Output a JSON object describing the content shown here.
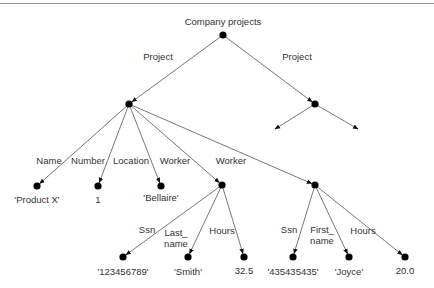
{
  "colors": {
    "edge": "#555555",
    "node": "#000000",
    "text": "#333333",
    "rule": "#999999"
  },
  "root": {
    "label": "Company projects",
    "x": 223,
    "y": 35
  },
  "nodes": [
    {
      "id": "root",
      "x": 223,
      "y": 35
    },
    {
      "id": "p1",
      "x": 129,
      "y": 104
    },
    {
      "id": "p2",
      "x": 315,
      "y": 104
    },
    {
      "id": "name",
      "x": 37,
      "y": 186
    },
    {
      "id": "number",
      "x": 98,
      "y": 186
    },
    {
      "id": "location",
      "x": 161,
      "y": 186
    },
    {
      "id": "w1",
      "x": 222,
      "y": 185
    },
    {
      "id": "w2",
      "x": 315,
      "y": 185
    },
    {
      "id": "ssn1",
      "x": 123,
      "y": 257
    },
    {
      "id": "last",
      "x": 188,
      "y": 257
    },
    {
      "id": "hours1",
      "x": 244,
      "y": 257
    },
    {
      "id": "ssn2",
      "x": 293,
      "y": 257
    },
    {
      "id": "first",
      "x": 349,
      "y": 257
    },
    {
      "id": "hours2",
      "x": 405,
      "y": 257
    }
  ],
  "edges": [
    {
      "from": [
        223,
        35
      ],
      "to": [
        129,
        104
      ]
    },
    {
      "from": [
        223,
        35
      ],
      "to": [
        315,
        104
      ]
    },
    {
      "from": [
        315,
        104
      ],
      "to": [
        275,
        129
      ],
      "dangling": true
    },
    {
      "from": [
        315,
        104
      ],
      "to": [
        358,
        129
      ],
      "dangling": true
    },
    {
      "from": [
        129,
        104
      ],
      "to": [
        37,
        186
      ]
    },
    {
      "from": [
        129,
        104
      ],
      "to": [
        98,
        186
      ]
    },
    {
      "from": [
        129,
        104
      ],
      "to": [
        161,
        186
      ]
    },
    {
      "from": [
        129,
        104
      ],
      "to": [
        222,
        185
      ]
    },
    {
      "from": [
        129,
        104
      ],
      "to": [
        315,
        185
      ]
    },
    {
      "from": [
        222,
        185
      ],
      "to": [
        123,
        257
      ]
    },
    {
      "from": [
        222,
        185
      ],
      "to": [
        188,
        257
      ]
    },
    {
      "from": [
        222,
        185
      ],
      "to": [
        244,
        257
      ]
    },
    {
      "from": [
        315,
        185
      ],
      "to": [
        293,
        257
      ]
    },
    {
      "from": [
        315,
        185
      ],
      "to": [
        349,
        257
      ]
    },
    {
      "from": [
        315,
        185
      ],
      "to": [
        405,
        257
      ]
    }
  ],
  "edge_labels": [
    {
      "text": "Project",
      "x": 158,
      "y": 60
    },
    {
      "text": "Project",
      "x": 297,
      "y": 60
    },
    {
      "text": "Name",
      "x": 49,
      "y": 164
    },
    {
      "text": "Number",
      "x": 88,
      "y": 164
    },
    {
      "text": "Location",
      "x": 131,
      "y": 164
    },
    {
      "text": "Worker",
      "x": 175,
      "y": 164
    },
    {
      "text": "Worker",
      "x": 231,
      "y": 164
    },
    {
      "text": "Ssn",
      "x": 147,
      "y": 233
    },
    {
      "text": "Last_",
      "x": 176,
      "y": 236
    },
    {
      "text": "name",
      "x": 176,
      "y": 247
    },
    {
      "text": "Hours",
      "x": 222,
      "y": 234
    },
    {
      "text": "Ssn",
      "x": 289,
      "y": 233
    },
    {
      "text": "First_",
      "x": 322,
      "y": 233
    },
    {
      "text": "name",
      "x": 322,
      "y": 244
    },
    {
      "text": "Hours",
      "x": 363,
      "y": 234
    }
  ],
  "leaf_values": [
    {
      "text": "'Product X'",
      "x": 37,
      "y": 203
    },
    {
      "text": "1",
      "x": 98,
      "y": 203
    },
    {
      "text": "'Bellaire'",
      "x": 161,
      "y": 201
    },
    {
      "text": "'123456789'",
      "x": 123,
      "y": 275
    },
    {
      "text": "'Smith'",
      "x": 188,
      "y": 275
    },
    {
      "text": "32.5",
      "x": 244,
      "y": 274
    },
    {
      "text": "'435435435'",
      "x": 293,
      "y": 275
    },
    {
      "text": "'Joyce'",
      "x": 349,
      "y": 275
    },
    {
      "text": "20.0",
      "x": 405,
      "y": 274
    }
  ]
}
